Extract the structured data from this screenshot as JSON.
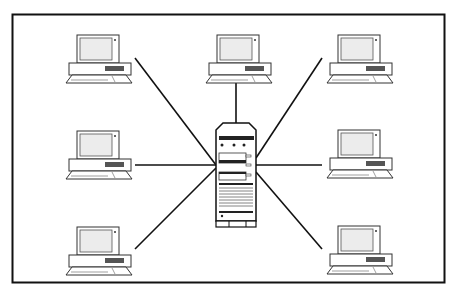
{
  "diagram": {
    "type": "star-network-topology",
    "hub": {
      "label": "",
      "icon": "server-tower-icon"
    },
    "nodes": [
      {
        "id": "top-left",
        "icon": "desktop-computer-icon"
      },
      {
        "id": "top-center",
        "icon": "desktop-computer-icon"
      },
      {
        "id": "top-right",
        "icon": "desktop-computer-icon"
      },
      {
        "id": "middle-left",
        "icon": "desktop-computer-icon"
      },
      {
        "id": "middle-right",
        "icon": "desktop-computer-icon"
      },
      {
        "id": "bottom-left",
        "icon": "desktop-computer-icon"
      },
      {
        "id": "bottom-right",
        "icon": "desktop-computer-icon"
      }
    ],
    "colors": {
      "line": "#111111",
      "frame": "#111111",
      "screen": "#e8e8e8",
      "panel": "#555555"
    }
  }
}
